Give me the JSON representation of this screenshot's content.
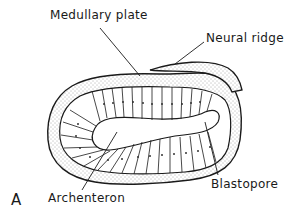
{
  "figure": {
    "panel_letter": "A"
  },
  "labels": {
    "medullary_plate": "Medullary plate",
    "neural_ridge": "Neural ridge",
    "blastopore": "Blastopore",
    "archenteron": "Archenteron"
  },
  "colors": {
    "ink": "#1a1a1a",
    "background": "#ffffff"
  }
}
